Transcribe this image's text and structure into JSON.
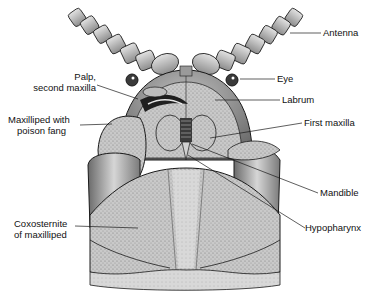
{
  "diagram": {
    "labels": {
      "antenna": "Antenna",
      "eye": "Eye",
      "labrum": "Labrum",
      "first_maxilla": "First maxilla",
      "mandible": "Mandible",
      "hypopharynx": "Hypopharynx",
      "palp_line1": "Palp,",
      "palp_line2": "second maxilla",
      "maxilliped_line1": "Maxilliped with",
      "maxilliped_line2": "poison fang",
      "coxosternite_line1": "Coxosternite",
      "coxosternite_line2": "of maxilliped"
    },
    "colors": {
      "ink": "#1a1a1a",
      "shade_dark": "#6e6e6e",
      "shade_mid": "#a9a9a9",
      "shade_light": "#cfcfcf",
      "background": "#ffffff"
    }
  }
}
